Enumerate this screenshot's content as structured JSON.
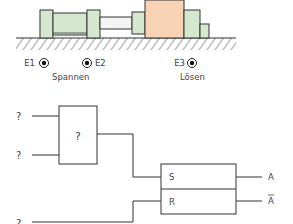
{
  "machine": {
    "colors": {
      "cylinder_fill": "#d5e8cf",
      "workpiece_fill": "#f7d2b4",
      "rod_fill": "#f4f4f4",
      "stroke": "#333333",
      "ground_hatch": "#555555"
    },
    "sensors": [
      {
        "id": "E1",
        "label": "E1"
      },
      {
        "id": "E2",
        "label": "E2"
      },
      {
        "id": "E3",
        "label": "E3"
      }
    ],
    "captions": {
      "spannen": "Spannen",
      "loesen": "Lösen"
    }
  },
  "logic": {
    "inputs": [
      "?",
      "?",
      "?"
    ],
    "gate_label": "?",
    "latch": {
      "set_label": "S",
      "reset_label": "R"
    },
    "outputs": [
      "A",
      "A"
    ],
    "output_negated": [
      false,
      true
    ]
  }
}
